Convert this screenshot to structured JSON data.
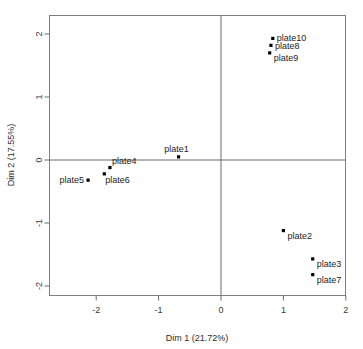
{
  "chart_data": {
    "type": "scatter",
    "title": "",
    "xlabel": "Dim 1 (21.72%)",
    "ylabel": "Dim 2 (17.55%)",
    "xlim": [
      -2.75,
      2.0
    ],
    "ylim": [
      -2.14,
      2.14
    ],
    "xticks": [
      -2,
      -1,
      0,
      1,
      2
    ],
    "xticklabels": [
      "-2",
      "-1",
      "0",
      "1",
      "2"
    ],
    "yticks": [
      -2,
      -1,
      0,
      1,
      2
    ],
    "yticklabels": [
      "-2",
      "-1",
      "0",
      "1",
      "2"
    ],
    "grid": false,
    "legend": "none",
    "reference_lines": [
      {
        "axis": "x",
        "value": 0
      },
      {
        "axis": "y",
        "value": 0
      }
    ],
    "points": [
      {
        "label": "plate1",
        "x": -0.68,
        "y": 0.05,
        "label_dx": -2,
        "label_dy": -5,
        "anchor": "middle"
      },
      {
        "label": "plate2",
        "x": 1.0,
        "y": -1.12,
        "label_dx": 4,
        "label_dy": 8,
        "anchor": "start"
      },
      {
        "label": "plate3",
        "x": 1.47,
        "y": -1.57,
        "label_dx": 4,
        "label_dy": 8,
        "anchor": "start"
      },
      {
        "label": "plate4",
        "x": -1.78,
        "y": -0.12,
        "label_dx": 2,
        "label_dy": -4,
        "anchor": "start"
      },
      {
        "label": "plate5",
        "x": -2.13,
        "y": -0.32,
        "label_dx": -4,
        "label_dy": 3,
        "anchor": "end"
      },
      {
        "label": "plate6",
        "x": -1.87,
        "y": -0.22,
        "label_dx": 1,
        "label_dy": 9,
        "anchor": "start"
      },
      {
        "label": "plate7",
        "x": 1.47,
        "y": -1.82,
        "label_dx": 4,
        "label_dy": 8,
        "anchor": "start"
      },
      {
        "label": "plate8",
        "x": 0.8,
        "y": 1.82,
        "label_dx": 4,
        "label_dy": 4,
        "anchor": "start"
      },
      {
        "label": "plate9",
        "x": 0.78,
        "y": 1.7,
        "label_dx": 4,
        "label_dy": 8,
        "anchor": "start"
      },
      {
        "label": "plate10",
        "x": 0.83,
        "y": 1.93,
        "label_dx": 4,
        "label_dy": 3,
        "anchor": "start"
      }
    ]
  },
  "axes": {
    "x_title": "Dim 1 (21.72%)",
    "y_title": "Dim 2 (17.55%)"
  },
  "colors": {
    "point": "#000000",
    "frame": "#808080",
    "axis": "#6b6b6b",
    "text": "#1c1c1c",
    "background": "#ffffff"
  }
}
